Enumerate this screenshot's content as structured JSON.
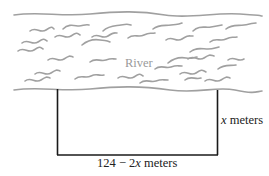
{
  "diagram": {
    "river": {
      "label": "River",
      "color": "#a0a0a0"
    },
    "fence": {
      "color": "#1a1a1a",
      "side_label_var": "x",
      "side_label_unit": " meters",
      "bottom_label_prefix": "124 − 2",
      "bottom_label_var": "x",
      "bottom_label_unit": " meters"
    },
    "geometry": {
      "left_x": 57,
      "right_x": 217,
      "top_y": 89,
      "bottom_y": 155
    }
  }
}
